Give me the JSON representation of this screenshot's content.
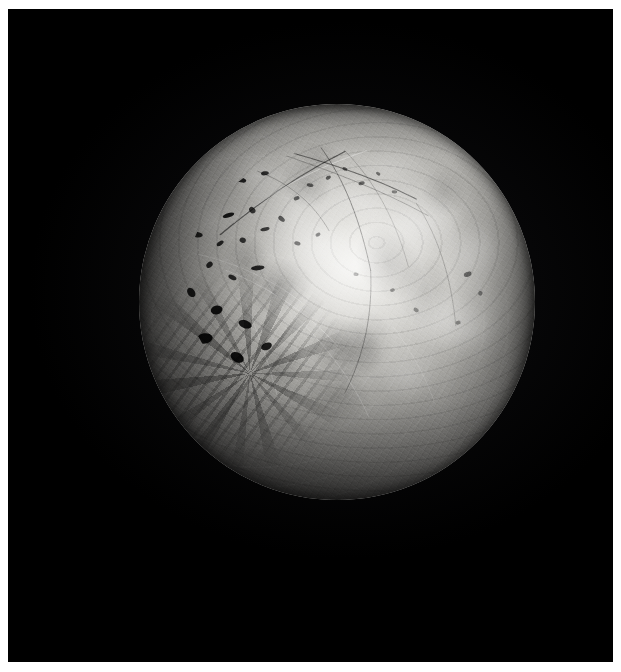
{
  "image": {
    "domain": "Natural-Image",
    "subject": "planetary-body-disk",
    "caption": "Grayscale spacecraft photograph of an illuminated planetary moon disk against black space",
    "orientation": "portrait",
    "canvas_width": 621,
    "canvas_height": 672
  },
  "frame": {
    "border_color": "#ffffff",
    "border_left": 8,
    "border_top": 9,
    "border_right": 8,
    "border_bottom": 10,
    "field_color": "#000000",
    "field_width": 605,
    "field_height": 653
  },
  "colors": {
    "space_black": "#000000",
    "limb_shadow": "#030303",
    "terminator_dark": "#0b0b0b",
    "midtone_gray": "#8c8b88",
    "highlight_gray": "#d6d5d1",
    "brightest_white": "#f2f1ee",
    "frame_white": "#ffffff"
  },
  "body": {
    "label": "planetary-disk",
    "center_x": 329,
    "center_y": 293,
    "radius": 198,
    "disk_left": 131,
    "disk_top": 95,
    "disk_diameter": 396,
    "illumination_fraction": 0.78,
    "sun_direction": "upper-right",
    "terminator_edge": "lower-left-to-bottom",
    "phase_description": "gibbous"
  },
  "surface_features": [
    {
      "name": "bright-albedo-plain",
      "description": "Large high-albedo bright patch near disk center-upper-right",
      "rel_x": 0.52,
      "rel_y": 0.42,
      "tone": "brightest"
    },
    {
      "name": "dark-pit-cluster",
      "description": "Cluster of small elongated dark pits / paterae on the upper-left quadrant",
      "rel_x": 0.24,
      "rel_y": 0.28,
      "tone": "very-dark"
    },
    {
      "name": "linear-fracture-arcs",
      "description": "Long thin dark curvilinear grooves running across the northern limb",
      "rel_x": 0.46,
      "rel_y": 0.12,
      "tone": "dark-thin-line"
    },
    {
      "name": "chaotic-broken-terrain",
      "description": "Angular black blocks and shadowed chaos terrain on the lower-left limb",
      "rel_x": 0.25,
      "rel_y": 0.67,
      "tone": "black-angular"
    },
    {
      "name": "mottled-flow-fronts",
      "description": "Wispy mottled bright-and-dark flow boundaries across the eastern hemisphere",
      "rel_x": 0.76,
      "rel_y": 0.45,
      "tone": "mixed"
    },
    {
      "name": "terminator-shadow",
      "description": "Shadowed night side fading to pure black along the bottom of the disk",
      "rel_x": 0.5,
      "rel_y": 0.9,
      "tone": "black"
    }
  ],
  "pits": [
    {
      "x": 0.205,
      "y": 0.216,
      "w": 0.036,
      "h": 0.013,
      "r": -24,
      "o": 0.92
    },
    {
      "x": 0.258,
      "y": 0.192,
      "w": 0.026,
      "h": 0.012,
      "r": 12,
      "o": 0.85
    },
    {
      "x": 0.318,
      "y": 0.175,
      "w": 0.02,
      "h": 0.01,
      "r": -8,
      "o": 0.8
    },
    {
      "x": 0.168,
      "y": 0.262,
      "w": 0.022,
      "h": 0.012,
      "r": 32,
      "o": 0.88
    },
    {
      "x": 0.226,
      "y": 0.281,
      "w": 0.03,
      "h": 0.011,
      "r": -18,
      "o": 0.9
    },
    {
      "x": 0.286,
      "y": 0.268,
      "w": 0.018,
      "h": 0.014,
      "r": 48,
      "o": 0.78
    },
    {
      "x": 0.147,
      "y": 0.33,
      "w": 0.028,
      "h": 0.014,
      "r": 6,
      "o": 0.84
    },
    {
      "x": 0.205,
      "y": 0.352,
      "w": 0.02,
      "h": 0.01,
      "r": -36,
      "o": 0.82
    },
    {
      "x": 0.262,
      "y": 0.344,
      "w": 0.016,
      "h": 0.013,
      "r": 18,
      "o": 0.76
    },
    {
      "x": 0.318,
      "y": 0.316,
      "w": 0.024,
      "h": 0.009,
      "r": -12,
      "o": 0.8
    },
    {
      "x": 0.36,
      "y": 0.29,
      "w": 0.019,
      "h": 0.011,
      "r": 40,
      "o": 0.72
    },
    {
      "x": 0.398,
      "y": 0.238,
      "w": 0.015,
      "h": 0.01,
      "r": -20,
      "o": 0.68
    },
    {
      "x": 0.432,
      "y": 0.205,
      "w": 0.017,
      "h": 0.009,
      "r": 10,
      "o": 0.66
    },
    {
      "x": 0.478,
      "y": 0.186,
      "w": 0.014,
      "h": 0.009,
      "r": -30,
      "o": 0.6
    },
    {
      "x": 0.52,
      "y": 0.164,
      "w": 0.013,
      "h": 0.008,
      "r": 22,
      "o": 0.55
    },
    {
      "x": 0.562,
      "y": 0.2,
      "w": 0.016,
      "h": 0.009,
      "r": -14,
      "o": 0.52
    },
    {
      "x": 0.604,
      "y": 0.176,
      "w": 0.012,
      "h": 0.008,
      "r": 34,
      "o": 0.48
    },
    {
      "x": 0.645,
      "y": 0.222,
      "w": 0.014,
      "h": 0.008,
      "r": 4,
      "o": 0.46
    },
    {
      "x": 0.3,
      "y": 0.414,
      "w": 0.034,
      "h": 0.012,
      "r": -6,
      "o": 0.86
    },
    {
      "x": 0.236,
      "y": 0.438,
      "w": 0.022,
      "h": 0.011,
      "r": 26,
      "o": 0.8
    },
    {
      "x": 0.178,
      "y": 0.406,
      "w": 0.018,
      "h": 0.013,
      "r": -42,
      "o": 0.82
    },
    {
      "x": 0.4,
      "y": 0.352,
      "w": 0.016,
      "h": 0.01,
      "r": 16,
      "o": 0.62
    },
    {
      "x": 0.452,
      "y": 0.33,
      "w": 0.013,
      "h": 0.009,
      "r": -26,
      "o": 0.56
    },
    {
      "x": 0.83,
      "y": 0.43,
      "w": 0.012,
      "h": 0.02,
      "r": 70,
      "o": 0.5
    },
    {
      "x": 0.862,
      "y": 0.478,
      "w": 0.011,
      "h": 0.012,
      "r": 15,
      "o": 0.44
    },
    {
      "x": 0.806,
      "y": 0.552,
      "w": 0.013,
      "h": 0.01,
      "r": -10,
      "o": 0.42
    },
    {
      "x": 0.7,
      "y": 0.52,
      "w": 0.014,
      "h": 0.01,
      "r": 28,
      "o": 0.4
    },
    {
      "x": 0.64,
      "y": 0.47,
      "w": 0.012,
      "h": 0.009,
      "r": -18,
      "o": 0.42
    },
    {
      "x": 0.548,
      "y": 0.43,
      "w": 0.013,
      "h": 0.009,
      "r": 8,
      "o": 0.44
    },
    {
      "x": 0.132,
      "y": 0.476,
      "w": 0.026,
      "h": 0.018,
      "r": 52,
      "o": 0.88
    },
    {
      "x": 0.196,
      "y": 0.52,
      "w": 0.03,
      "h": 0.022,
      "r": -14,
      "o": 0.92
    },
    {
      "x": 0.268,
      "y": 0.556,
      "w": 0.034,
      "h": 0.02,
      "r": 20,
      "o": 0.9
    },
    {
      "x": 0.166,
      "y": 0.592,
      "w": 0.04,
      "h": 0.026,
      "r": -8,
      "o": 0.94
    },
    {
      "x": 0.248,
      "y": 0.64,
      "w": 0.036,
      "h": 0.024,
      "r": 30,
      "o": 0.94
    },
    {
      "x": 0.322,
      "y": 0.612,
      "w": 0.028,
      "h": 0.018,
      "r": -22,
      "o": 0.88
    }
  ],
  "fractures": [
    {
      "d": "M 0.205 0.330 C 0.300 0.250, 0.400 0.180, 0.520 0.120",
      "w": 1.3,
      "o": 0.55,
      "tone": "dark"
    },
    {
      "d": "M 0.240 0.300 C 0.340 0.215, 0.450 0.160, 0.575 0.118",
      "w": 0.9,
      "o": 0.38,
      "tone": "light"
    },
    {
      "d": "M 0.330 0.108 C 0.450 0.140, 0.580 0.178, 0.700 0.240",
      "w": 1.2,
      "o": 0.5,
      "tone": "dark"
    },
    {
      "d": "M 0.355 0.125 C 0.470 0.165, 0.600 0.210, 0.730 0.282",
      "w": 0.8,
      "o": 0.32,
      "tone": "dark"
    },
    {
      "d": "M 0.455 0.104 C 0.520 0.190, 0.560 0.300, 0.585 0.420",
      "w": 1.0,
      "o": 0.4,
      "tone": "dark"
    },
    {
      "d": "M 0.300 0.170 C 0.380 0.200, 0.440 0.250, 0.480 0.320",
      "w": 0.8,
      "o": 0.34,
      "tone": "dark"
    },
    {
      "d": "M 0.520 0.118 C 0.600 0.200, 0.650 0.300, 0.680 0.410",
      "w": 0.7,
      "o": 0.28,
      "tone": "dark"
    },
    {
      "d": "M 0.585 0.420 C 0.590 0.530, 0.570 0.630, 0.520 0.730",
      "w": 0.9,
      "o": 0.34,
      "tone": "dark"
    },
    {
      "d": "M 0.700 0.250 C 0.760 0.340, 0.790 0.450, 0.800 0.560",
      "w": 0.8,
      "o": 0.26,
      "tone": "dark"
    },
    {
      "d": "M 0.220 0.420 C 0.320 0.460, 0.420 0.520, 0.500 0.610",
      "w": 0.8,
      "o": 0.3,
      "tone": "light"
    },
    {
      "d": "M 0.150 0.380 C 0.240 0.400, 0.330 0.440, 0.410 0.500",
      "w": 0.7,
      "o": 0.26,
      "tone": "light"
    },
    {
      "d": "M 0.400 0.540 C 0.480 0.620, 0.540 0.700, 0.580 0.790",
      "w": 0.8,
      "o": 0.28,
      "tone": "light"
    },
    {
      "d": "M 0.640 0.560 C 0.700 0.640, 0.740 0.720, 0.760 0.800",
      "w": 0.7,
      "o": 0.22,
      "tone": "light"
    },
    {
      "d": "M 0.270 0.500 C 0.300 0.580, 0.330 0.660, 0.350 0.740",
      "w": 0.7,
      "o": 0.3,
      "tone": "light"
    }
  ],
  "flow_patches": [
    {
      "x": 0.72,
      "y": 0.3,
      "rx": 0.1,
      "ry": 0.07,
      "r": -15,
      "tone": "light",
      "o": 0.2
    },
    {
      "x": 0.83,
      "y": 0.4,
      "rx": 0.09,
      "ry": 0.09,
      "r": 25,
      "tone": "light",
      "o": 0.18
    },
    {
      "x": 0.78,
      "y": 0.55,
      "rx": 0.11,
      "ry": 0.08,
      "r": 10,
      "tone": "light",
      "o": 0.16
    },
    {
      "x": 0.63,
      "y": 0.4,
      "rx": 0.08,
      "ry": 0.1,
      "r": -30,
      "tone": "dark",
      "o": 0.16
    },
    {
      "x": 0.55,
      "y": 0.24,
      "rx": 0.1,
      "ry": 0.06,
      "r": 8,
      "tone": "light",
      "o": 0.22
    },
    {
      "x": 0.42,
      "y": 0.2,
      "rx": 0.07,
      "ry": 0.06,
      "r": 40,
      "tone": "dark",
      "o": 0.18
    },
    {
      "x": 0.35,
      "y": 0.46,
      "rx": 0.09,
      "ry": 0.07,
      "r": -20,
      "tone": "dark",
      "o": 0.2
    },
    {
      "x": 0.52,
      "y": 0.62,
      "rx": 0.1,
      "ry": 0.08,
      "r": 18,
      "tone": "dark",
      "o": 0.24
    },
    {
      "x": 0.68,
      "y": 0.68,
      "rx": 0.09,
      "ry": 0.07,
      "r": -10,
      "tone": "light",
      "o": 0.14
    },
    {
      "x": 0.46,
      "y": 0.36,
      "rx": 0.08,
      "ry": 0.06,
      "r": 30,
      "tone": "light",
      "o": 0.2
    }
  ]
}
